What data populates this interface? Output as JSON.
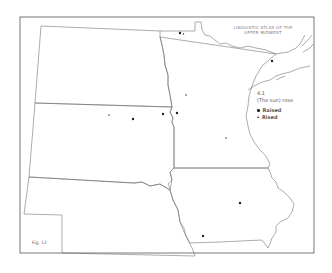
{
  "map": {
    "title_line1": "Linguistic Atlas of the",
    "title_line2": "Upper Midwest",
    "figure_label": "Fig. 12",
    "region": "Upper Midwest (ND, SD, NE, MN, IA)",
    "legend": {
      "item_number": "4.1",
      "phrase": "(The sun) rose",
      "entries": [
        {
          "symbol": "dot",
          "label": "Raised"
        },
        {
          "symbol": "triangle",
          "label": "Rised"
        }
      ]
    },
    "points": [
      {
        "x": 180,
        "y": 33,
        "symbol": "dot",
        "label": "Raised"
      },
      {
        "x": 183.5,
        "y": 34,
        "symbol": "triangle",
        "label": "Rised"
      },
      {
        "x": 272,
        "y": 61,
        "symbol": "dot",
        "label": "Raised"
      },
      {
        "x": 186,
        "y": 95,
        "symbol": "triangle",
        "label": "Rised"
      },
      {
        "x": 109,
        "y": 115,
        "symbol": "triangle",
        "label": "Rised"
      },
      {
        "x": 133,
        "y": 119,
        "symbol": "dot",
        "label": "Raised"
      },
      {
        "x": 163,
        "y": 114,
        "symbol": "dot",
        "label": "Raised"
      },
      {
        "x": 177,
        "y": 113,
        "symbol": "dot",
        "label": "Raised"
      },
      {
        "x": 226,
        "y": 138,
        "symbol": "triangle",
        "label": "Rised"
      },
      {
        "x": 240,
        "y": 203,
        "symbol": "dot",
        "label": "Raised"
      },
      {
        "x": 203,
        "y": 236,
        "symbol": "dot",
        "label": "Raised"
      }
    ],
    "colors": {
      "border": "#555555",
      "state_lines": "#666666",
      "symbols": "#222222",
      "background": "#ffffff"
    }
  }
}
